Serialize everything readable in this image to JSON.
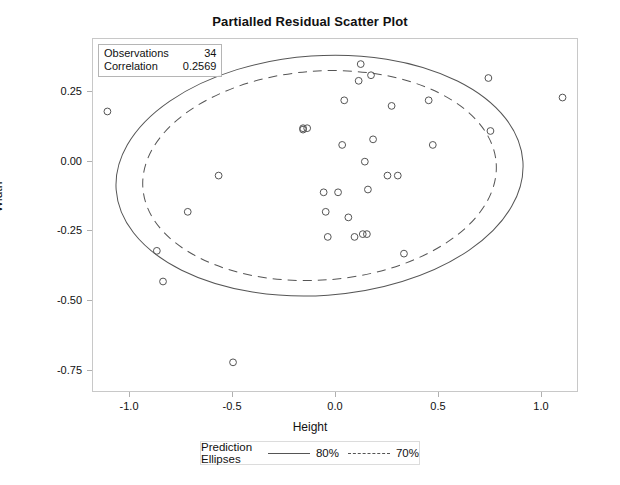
{
  "chart_data": {
    "type": "scatter",
    "title": "Partialled Residual Scatter Plot",
    "xlabel": "Height",
    "ylabel": "Width",
    "xlim": [
      -1.18,
      1.18
    ],
    "ylim": [
      -0.83,
      0.44
    ],
    "xticks": [
      "-1.0",
      "-0.5",
      "0.0",
      "0.5",
      "1.0"
    ],
    "xtick_values": [
      -1.0,
      -0.5,
      0.0,
      0.5,
      1.0
    ],
    "yticks": [
      "0.25",
      "0.00",
      "-0.25",
      "-0.50",
      "-0.75"
    ],
    "ytick_values": [
      0.25,
      0.0,
      -0.25,
      -0.5,
      -0.75
    ],
    "grid": false,
    "marker": "open-circle",
    "marker_color": "#555555",
    "points": [
      {
        "x": -1.11,
        "y": 0.18
      },
      {
        "x": -0.87,
        "y": -0.32
      },
      {
        "x": -0.84,
        "y": -0.43
      },
      {
        "x": -0.72,
        "y": -0.18
      },
      {
        "x": -0.57,
        "y": -0.05
      },
      {
        "x": -0.5,
        "y": -0.72
      },
      {
        "x": -0.16,
        "y": 0.12
      },
      {
        "x": -0.14,
        "y": 0.12
      },
      {
        "x": -0.06,
        "y": -0.11
      },
      {
        "x": -0.05,
        "y": -0.18
      },
      {
        "x": -0.04,
        "y": -0.27
      },
      {
        "x": 0.01,
        "y": -0.11
      },
      {
        "x": 0.03,
        "y": 0.06
      },
      {
        "x": 0.04,
        "y": 0.22
      },
      {
        "x": 0.06,
        "y": -0.2
      },
      {
        "x": 0.09,
        "y": -0.27
      },
      {
        "x": 0.11,
        "y": 0.29
      },
      {
        "x": 0.12,
        "y": 0.35
      },
      {
        "x": 0.13,
        "y": -0.26
      },
      {
        "x": 0.14,
        "y": 0.0
      },
      {
        "x": 0.15,
        "y": -0.26
      },
      {
        "x": 0.155,
        "y": -0.1
      },
      {
        "x": 0.17,
        "y": 0.31
      },
      {
        "x": 0.18,
        "y": 0.08
      },
      {
        "x": 0.25,
        "y": -0.05
      },
      {
        "x": 0.27,
        "y": 0.2
      },
      {
        "x": 0.3,
        "y": -0.05
      },
      {
        "x": 0.33,
        "y": -0.33
      },
      {
        "x": 0.45,
        "y": 0.22
      },
      {
        "x": 0.47,
        "y": 0.06
      },
      {
        "x": 0.74,
        "y": 0.3
      },
      {
        "x": 0.75,
        "y": 0.11
      },
      {
        "x": 1.1,
        "y": 0.23
      },
      {
        "x": -0.16,
        "y": 0.115
      }
    ],
    "ellipses": [
      {
        "label": "80%",
        "style": "solid",
        "center": [
          -0.08,
          -0.05
        ],
        "semi_major": 0.99,
        "semi_minor": 0.43,
        "rotation_deg": -4
      },
      {
        "label": "70%",
        "style": "dashed",
        "center": [
          -0.08,
          -0.05
        ],
        "semi_major": 0.86,
        "semi_minor": 0.375,
        "rotation_deg": -4
      }
    ],
    "annotations": {
      "stats_box": {
        "rows": [
          {
            "label": "Observations",
            "value": "34"
          },
          {
            "label": "Correlation",
            "value": "0.2569"
          }
        ]
      }
    },
    "legend": {
      "position": "bottom",
      "title": "Prediction Ellipses",
      "entries": [
        {
          "label": "80%",
          "style": "solid"
        },
        {
          "label": "70%",
          "style": "dashed"
        }
      ]
    }
  }
}
